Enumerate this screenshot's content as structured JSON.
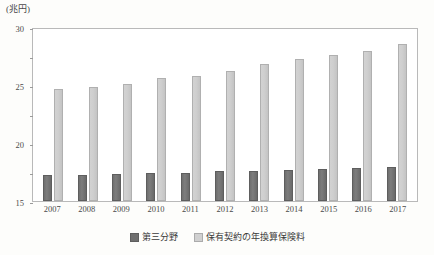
{
  "chart_data": {
    "type": "bar",
    "title": "",
    "subtitle": "",
    "xlabel": "",
    "ylabel": "(兆円)",
    "unit_label": "(兆円)",
    "ylim": [
      0,
      30
    ],
    "ytick_step": 5,
    "yticks": [
      0,
      5,
      10,
      15,
      20,
      25,
      30
    ],
    "ytick_labels": [
      "0",
      "5",
      "10",
      "15",
      "20",
      "25",
      "30"
    ],
    "grid": false,
    "legend_position": "bottom-center",
    "categories": [
      "2007",
      "2008",
      "2009",
      "2010",
      "2011",
      "2012",
      "2013",
      "2014",
      "2015",
      "2016",
      "2017"
    ],
    "series": [
      {
        "name": "第三分野",
        "color": "#6f6f6f",
        "values": [
          4.5,
          4.5,
          4.7,
          4.8,
          4.9,
          5.1,
          5.2,
          5.4,
          5.5,
          5.7,
          5.9
        ]
      },
      {
        "name": "保有契約の年換算保険料",
        "color": "#d0d0d0",
        "values": [
          19.3,
          19.6,
          20.2,
          21.2,
          21.6,
          22.5,
          23.7,
          24.4,
          25.1,
          25.9,
          27.1
        ]
      }
    ]
  },
  "legend": {
    "items": [
      {
        "label": "第三分野",
        "series_key": "dark"
      },
      {
        "label": "保有契約の年換算保険料",
        "series_key": "light"
      }
    ]
  }
}
